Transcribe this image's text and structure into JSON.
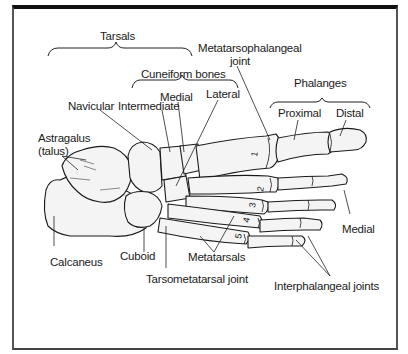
{
  "figure": {
    "labels": {
      "tarsals": "Tarsals",
      "cuneiform_bones": "Cuneiform bones",
      "medial_cuneiform": "Medial",
      "intermediate_cuneiform": "Intermediate",
      "lateral_cuneiform": "Lateral",
      "navicular": "Navicular",
      "astragalus_line1": "Astragalus",
      "astragalus_line2": "(talus)",
      "metatarsophalangeal_line1": "Metatarsophalangeal",
      "metatarsophalangeal_line2": "joint",
      "phalanges": "Phalanges",
      "proximal": "Proximal",
      "distal": "Distal",
      "medial_phalanx": "Medial",
      "calcaneus": "Calcaneus",
      "cuboid": "Cuboid",
      "metatarsals": "Metatarsals",
      "tarsometatarsal_joint": "Tarsometatarsal joint",
      "interphalangeal_joints": "Interphalangeal joints"
    },
    "metatarsal_numbers": [
      "1",
      "2",
      "3",
      "4",
      "5"
    ]
  }
}
